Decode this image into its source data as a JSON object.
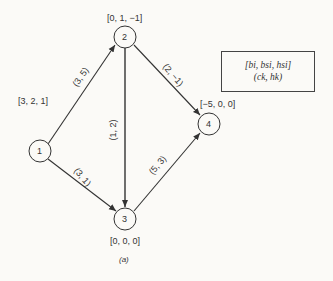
{
  "nodes": [
    {
      "id": "1",
      "label": "1",
      "attrs": "[3, 2, 1]"
    },
    {
      "id": "2",
      "label": "2",
      "attrs": "[0, 1, −1]"
    },
    {
      "id": "3",
      "label": "3",
      "attrs": "[0, 0, 0]"
    },
    {
      "id": "4",
      "label": "4",
      "attrs": "[−5, 0, 0]"
    }
  ],
  "edges": [
    {
      "from": "1",
      "to": "2",
      "label": "(3, 5)"
    },
    {
      "from": "1",
      "to": "3",
      "label": "(3, 1)"
    },
    {
      "from": "2",
      "to": "3",
      "label": "(1, 2)"
    },
    {
      "from": "2",
      "to": "4",
      "label": "(2, −1)"
    },
    {
      "from": "3",
      "to": "4",
      "label": "(5, 3)"
    }
  ],
  "legend": {
    "line1": "[bi, bsi, hsi]",
    "line2": "(ck, hk)"
  },
  "caption": "(a)"
}
